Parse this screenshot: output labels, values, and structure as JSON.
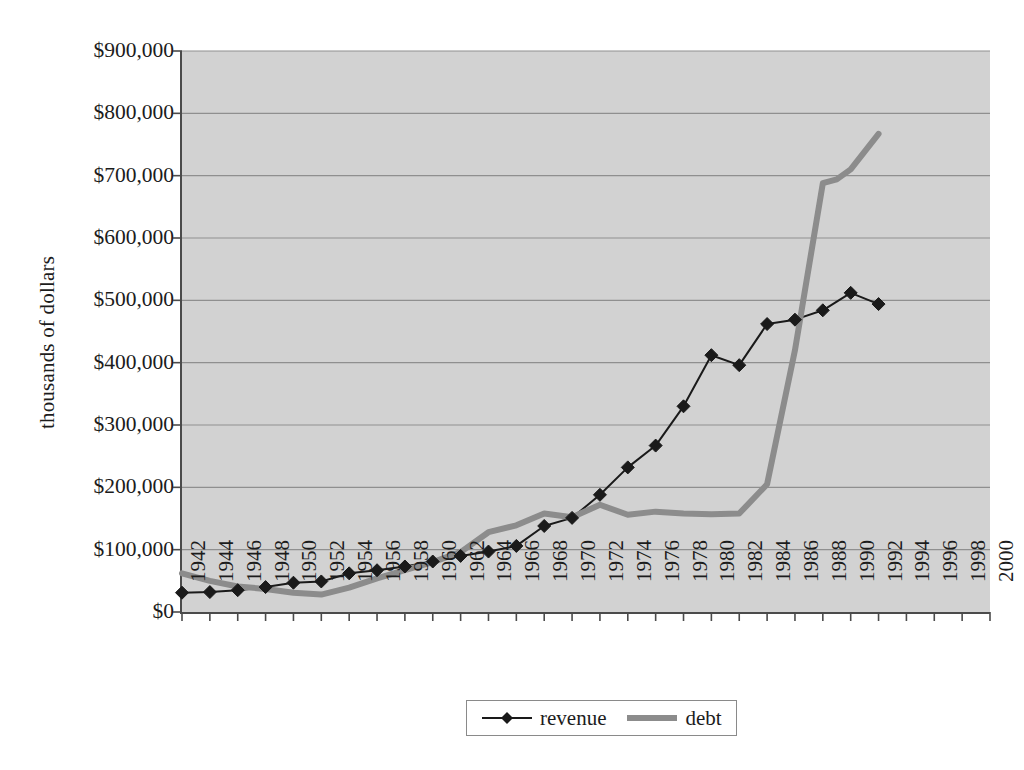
{
  "chart_data": {
    "type": "line",
    "title": "",
    "xlabel": "",
    "ylabel": "thousands of dollars",
    "xlim": [
      1942,
      2000
    ],
    "ylim": [
      0,
      900000
    ],
    "grid": true,
    "legend_position": "bottom",
    "y_ticks": [
      0,
      100000,
      200000,
      300000,
      400000,
      500000,
      600000,
      700000,
      800000,
      900000
    ],
    "y_tick_labels": [
      "$0",
      "$100,000",
      "$200,000",
      "$300,000",
      "$400,000",
      "$500,000",
      "$600,000",
      "$700,000",
      "$800,000",
      "$900,000"
    ],
    "x_ticks": [
      1942,
      1944,
      1946,
      1948,
      1950,
      1952,
      1954,
      1956,
      1958,
      1960,
      1962,
      1964,
      1966,
      1968,
      1970,
      1972,
      1974,
      1976,
      1978,
      1980,
      1982,
      1984,
      1986,
      1988,
      1990,
      1992,
      1994,
      1996,
      1998,
      2000
    ],
    "x_tick_labels": [
      "1942",
      "1944",
      "1946",
      "1948",
      "1950",
      "1952",
      "1954",
      "1956",
      "1958",
      "1960",
      "1962",
      "1964",
      "1966",
      "1968",
      "1970",
      "1972",
      "1974",
      "1976",
      "1978",
      "1980",
      "1982",
      "1984",
      "1986",
      "1988",
      "1990",
      "1992",
      "1994",
      "1996",
      "1998",
      "2000"
    ],
    "series": [
      {
        "name": "revenue",
        "color": "#1a1a1a",
        "marker": "diamond",
        "line_width": 2,
        "x": [
          1942,
          1944,
          1946,
          1948,
          1950,
          1952,
          1954,
          1956,
          1958,
          1960,
          1962,
          1964,
          1966,
          1968,
          1970,
          1972,
          1974,
          1976,
          1978,
          1980,
          1982,
          1984,
          1986,
          1988,
          1990,
          1992
        ],
        "values": [
          31000,
          32000,
          35000,
          40000,
          47000,
          49000,
          62000,
          67000,
          73000,
          81000,
          90000,
          97000,
          106000,
          138000,
          151000,
          188000,
          232000,
          267000,
          330000,
          412000,
          396000,
          462000,
          469000,
          484000,
          512000,
          494000
        ]
      },
      {
        "name": "debt",
        "color": "#8c8c8c",
        "marker": "none",
        "line_width": 6,
        "x": [
          1942,
          1944,
          1946,
          1948,
          1950,
          1952,
          1954,
          1956,
          1958,
          1960,
          1962,
          1964,
          1966,
          1968,
          1970,
          1972,
          1974,
          1976,
          1978,
          1980,
          1982,
          1984,
          1986,
          1988,
          1989,
          1990,
          1992
        ],
        "values": [
          62000,
          50000,
          41000,
          37000,
          31000,
          28000,
          39000,
          54000,
          67000,
          80000,
          96000,
          128000,
          139000,
          158000,
          152000,
          172000,
          156000,
          161000,
          158000,
          157000,
          158000,
          205000,
          420000,
          688000,
          694000,
          710000,
          767000
        ]
      }
    ]
  },
  "legend": {
    "entries": [
      {
        "label": "revenue",
        "swatch": "line-with-diamond-marker",
        "color": "#1a1a1a"
      },
      {
        "label": "debt",
        "swatch": "thick-gray-line",
        "color": "#8c8c8c"
      }
    ]
  },
  "colors": {
    "plot_background": "#d2d2d2",
    "gridline": "#8f8f8f",
    "axis": "#4b4b4b",
    "revenue": "#1a1a1a",
    "debt": "#8c8c8c",
    "page_background": "#ffffff",
    "text": "#1c1c1c"
  }
}
